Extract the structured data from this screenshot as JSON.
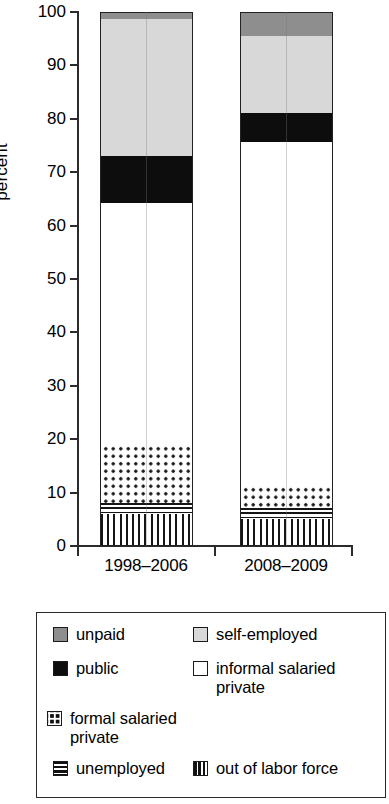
{
  "axis": {
    "ylabel": "percent",
    "yticks": [
      "100",
      "90",
      "80",
      "70",
      "60",
      "50",
      "40",
      "30",
      "20",
      "10",
      "0"
    ],
    "categories": [
      "1998–2006",
      "2008–2009"
    ]
  },
  "legend": {
    "items": [
      {
        "label": "unpaid",
        "swatch": "solid-dark-gray-swatch"
      },
      {
        "label": "self-employed",
        "swatch": "solid-light-gray-swatch"
      },
      {
        "label": "public",
        "swatch": "solid-black-swatch"
      },
      {
        "label": "informal salaried private",
        "swatch": "empty-white-swatch"
      },
      {
        "label": "formal salaried private",
        "swatch": "dotted-swatch"
      },
      {
        "label": "unemployed",
        "swatch": "horizontal-stripe-swatch"
      },
      {
        "label": "out of labor force",
        "swatch": "vertical-stripe-swatch"
      }
    ]
  },
  "chart_data": {
    "type": "bar",
    "title": "",
    "subtitle": "",
    "stacked": true,
    "xlabel": "",
    "ylabel": "percent",
    "ylim": [
      0,
      100
    ],
    "ytick_step": 10,
    "grid": false,
    "legend_position": "bottom",
    "categories": [
      "1998–2006",
      "2008–2009"
    ],
    "series": [
      {
        "name": "out of labor force",
        "values": [
          6.0,
          5.0
        ],
        "fill": "vertical-stripes",
        "color": "#ffffff"
      },
      {
        "name": "unemployed",
        "values": [
          2.1,
          2.1
        ],
        "fill": "horizontal-stripes",
        "color": "#ffffff"
      },
      {
        "name": "formal salaried private",
        "values": [
          11.0,
          4.4
        ],
        "fill": "dots",
        "color": "#ffffff"
      },
      {
        "name": "informal salaried private",
        "values": [
          45.2,
          64.1
        ],
        "fill": "solid",
        "color": "#ffffff"
      },
      {
        "name": "public",
        "values": [
          8.7,
          5.4
        ],
        "fill": "solid",
        "color": "#0d0d0d"
      },
      {
        "name": "self-employed",
        "values": [
          25.7,
          14.5
        ],
        "fill": "solid",
        "color": "#d8d8d8"
      },
      {
        "name": "unpaid",
        "values": [
          1.3,
          4.5
        ],
        "fill": "solid",
        "color": "#8e8e8e"
      }
    ],
    "cumulative_tops": {
      "1998–2006": [
        6.0,
        8.1,
        19.1,
        64.3,
        73.0,
        98.7,
        100.0
      ],
      "2008–2009": [
        5.0,
        7.1,
        11.5,
        75.6,
        81.0,
        95.5,
        100.0
      ]
    }
  }
}
